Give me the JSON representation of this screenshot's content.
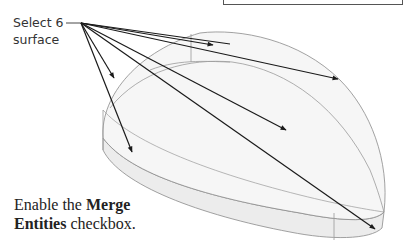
{
  "callout": {
    "line1": "Select 6",
    "line2": "surface"
  },
  "instruction": {
    "prefix": "Enable the ",
    "bold1": "Merge",
    "bold2": "Entities",
    "suffix": " checkbox."
  },
  "figure": {
    "arrow_count": 6,
    "colors": {
      "edge": "#8a8a8a",
      "arrow": "#1a1a1a",
      "face_fill": "#f3f3f3",
      "side_fill": "#ececec"
    }
  }
}
